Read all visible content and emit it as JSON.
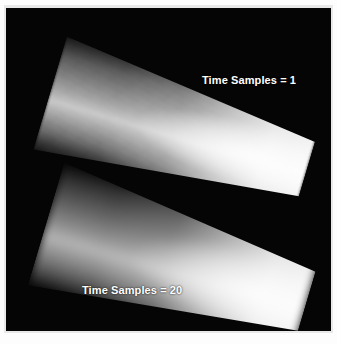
{
  "figure": {
    "panel_background": "#050505",
    "page_background": "#ffffff",
    "frame_color": "#e9e9e9",
    "label_color": "#ffffff"
  },
  "labels": {
    "top": "Time Samples = 1",
    "bottom": "Time Samples = 20"
  },
  "beams": [
    {
      "id": "beam-top",
      "label": "Time Samples = 1",
      "time_samples": 1,
      "rendering": "single-sample, speckled / noisy, hard bright core",
      "rotation_deg": 16.5,
      "peak_color": "#ffffff",
      "rim_color": "#2e2e2e"
    },
    {
      "id": "beam-bottom",
      "label": "Time Samples = 20",
      "time_samples": 20,
      "rendering": "20-sample average, smooth / motion-blurred falloff",
      "rotation_deg": 16.5,
      "peak_color": "#f5f5f5",
      "rim_color": "#242424"
    }
  ]
}
